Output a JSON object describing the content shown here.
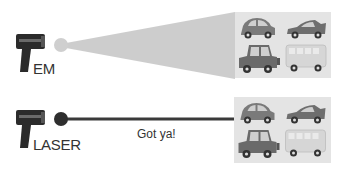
{
  "diagram": {
    "rows": [
      {
        "id": "em",
        "label": "EM",
        "beam_type": "cone",
        "emitter_color": "#cfcfcf",
        "beam_color": "#c8c8c8",
        "targets": [
          "hatchback-car",
          "sports-car",
          "jeep",
          "van"
        ]
      },
      {
        "id": "laser",
        "label": "LASER",
        "beam_type": "line",
        "emitter_color": "#2e2e2e",
        "beam_color": "#3a3a3a",
        "caption": "Got ya!",
        "targets": [
          "hatchback-car",
          "sports-car",
          "jeep",
          "van"
        ]
      }
    ],
    "colors": {
      "gun": "#2b2b2b",
      "panel": "#e4e4e4",
      "car": "#7a7a7a",
      "van": "#d6d6d6"
    }
  }
}
